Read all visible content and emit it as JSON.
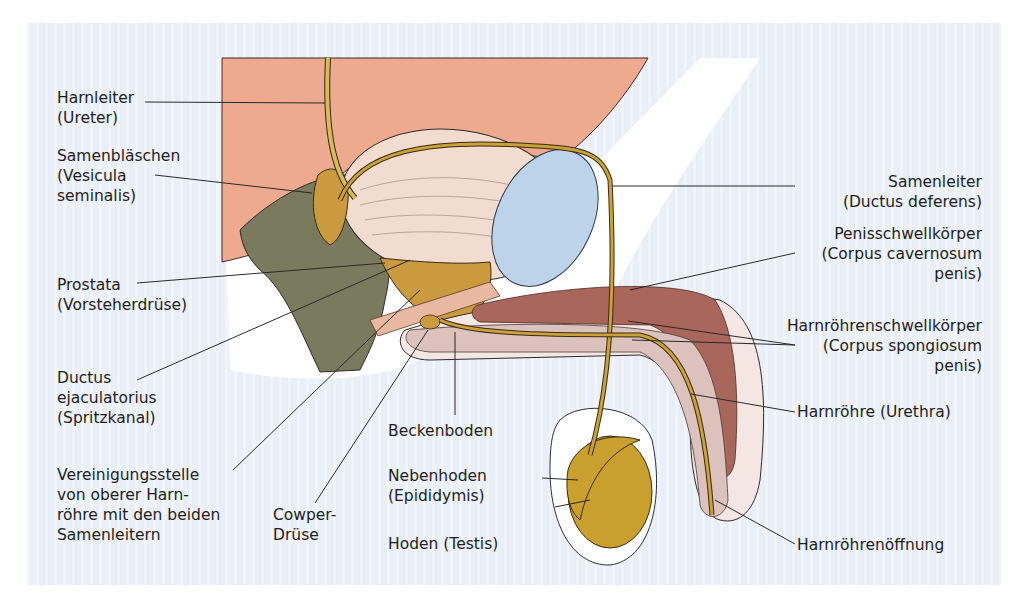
{
  "figure": {
    "background_color": "#eaeef6",
    "colors": {
      "body_tissue": "#eeaa8f",
      "bladder": "#f2dcd0",
      "rectum": "#7a7a5e",
      "duct_gold": "#c9a23a",
      "prostate_gland": "#c99a3e",
      "pubic_bone": "#bcd3ea",
      "corpus_cavernosum": "#a8675a",
      "corpus_spongiosum": "#dcc2bd",
      "testis": "#c9a02e"
    }
  },
  "labels": {
    "ureter": [
      "Harnleiter",
      "(Ureter)"
    ],
    "seminal_vesicle": [
      "Samenbläschen",
      "(Vesicula",
      "seminalis)"
    ],
    "prostate": [
      "Prostata",
      "(Vorsteherdrüse)"
    ],
    "ejaculatory_duct": [
      "Ductus",
      "ejaculatorius",
      "(Spritzkanal)"
    ],
    "junction": [
      "Vereinigungsstelle",
      "von oberer Harn-",
      "röhre mit den beiden",
      "Samenleitern"
    ],
    "cowper": [
      "Cowper-",
      "Drüse"
    ],
    "pelvic_floor": [
      "Beckenboden"
    ],
    "epididymis": [
      "Nebenhoden",
      "(Epididymis)"
    ],
    "testis": [
      "Hoden (Testis)"
    ],
    "vas_deferens": [
      "Samenleiter",
      "(Ductus deferens)"
    ],
    "corpus_cavernosum": [
      "Penisschwellkörper",
      "(Corpus cavernosum",
      "penis)"
    ],
    "corpus_spongiosum": [
      "Harnröhrenschwellkörper",
      "(Corpus spongiosum",
      "penis)"
    ],
    "urethra": [
      "Harnröhre (Urethra)"
    ],
    "urethral_opening": [
      "Harnröhrenöffnung"
    ]
  }
}
